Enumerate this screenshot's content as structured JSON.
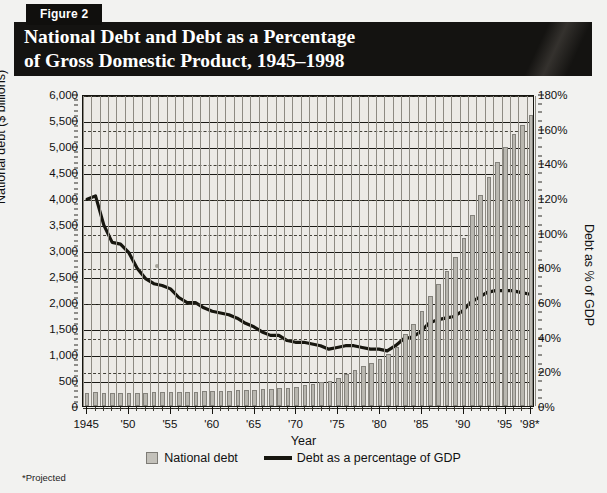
{
  "header": {
    "figure_tag": "Figure 2",
    "title": "National Debt and Debt as a Percentage\nof Gross Domestic Product, 1945–1998"
  },
  "legend": {
    "bar_label": "National debt",
    "line_label": "Debt as a percentage of GDP"
  },
  "footnote": "*Projected",
  "colors": {
    "bar_fill": "#b9b7b0",
    "bar_stroke": "#84827c",
    "line": "#17160f",
    "plot_bg": "#eceae6",
    "header_band": "#141311",
    "page_bg": "#f2f2f0"
  },
  "chart_data": {
    "type": "bar",
    "title": "National Debt and Debt as a Percentage of Gross Domestic Product, 1945–1998",
    "xlabel": "Year",
    "ylabel": "National debt ($ billions)",
    "y2label": "Debt as % of GDP",
    "ylim": [
      0,
      6000
    ],
    "y2lim": [
      0,
      180
    ],
    "ytick_step": 500,
    "y2tick_step": 20,
    "grid": true,
    "legend_position": "bottom-center",
    "ytick_labels": [
      "0",
      "500",
      "1,000",
      "1,500",
      "2,000",
      "2,500",
      "3,000",
      "3,500",
      "4,000",
      "4,500",
      "5,000",
      "5,500",
      "6,000"
    ],
    "y2tick_labels": [
      "0%",
      "20%",
      "40%",
      "60%",
      "80%",
      "100%",
      "120%",
      "140%",
      "160%",
      "180%"
    ],
    "xtick_labels": [
      "1945",
      "'50",
      "'55",
      "'60",
      "'65",
      "'70",
      "'75",
      "'80",
      "'85",
      "'90",
      "'95",
      "'98*"
    ],
    "xtick_years": [
      1945,
      1950,
      1955,
      1960,
      1965,
      1970,
      1975,
      1980,
      1985,
      1990,
      1995,
      1998
    ],
    "x": [
      1945,
      1946,
      1947,
      1948,
      1949,
      1950,
      1951,
      1952,
      1953,
      1954,
      1955,
      1956,
      1957,
      1958,
      1959,
      1960,
      1961,
      1962,
      1963,
      1964,
      1965,
      1966,
      1967,
      1968,
      1969,
      1970,
      1971,
      1972,
      1973,
      1974,
      1975,
      1976,
      1977,
      1978,
      1979,
      1980,
      1981,
      1982,
      1983,
      1984,
      1985,
      1986,
      1987,
      1988,
      1989,
      1990,
      1991,
      1992,
      1993,
      1994,
      1995,
      1996,
      1997,
      1998
    ],
    "series": [
      {
        "name": "National debt",
        "unit": "$ billions",
        "axis": "left",
        "type": "bar",
        "values": [
          259,
          271,
          257,
          252,
          253,
          257,
          255,
          259,
          266,
          271,
          274,
          273,
          271,
          276,
          285,
          286,
          289,
          298,
          306,
          312,
          317,
          320,
          326,
          348,
          354,
          371,
          398,
          427,
          458,
          475,
          533,
          620,
          699,
          772,
          827,
          908,
          998,
          1142,
          1377,
          1572,
          1823,
          2125,
          2350,
          2602,
          2857,
          3233,
          3665,
          4065,
          4411,
          4693,
          4974,
          5225,
          5413,
          5600
        ]
      },
      {
        "name": "Debt as a percentage of GDP",
        "unit": "%",
        "axis": "right",
        "type": "line",
        "values": [
          120,
          122,
          105,
          95,
          94,
          89,
          80,
          74,
          71,
          70,
          68,
          63,
          60,
          60,
          57,
          55,
          54,
          53,
          51,
          48,
          46,
          43,
          41,
          41,
          38,
          37,
          37,
          36,
          35,
          33,
          34,
          35,
          35,
          34,
          33,
          33,
          32,
          35,
          39,
          40,
          43,
          48,
          50,
          51,
          52,
          55,
          60,
          63,
          66,
          67,
          67,
          67,
          66,
          65
        ]
      }
    ],
    "annotations": [
      "*Projected"
    ]
  }
}
